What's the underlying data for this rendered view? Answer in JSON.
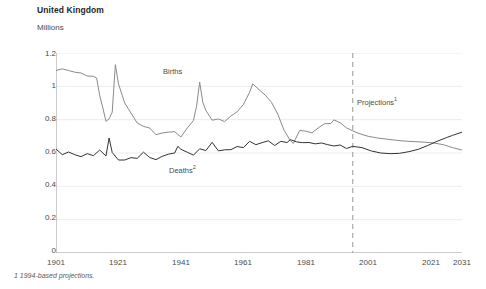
{
  "title": "United Kingdom",
  "units": "Millions",
  "footnote": "1  1994-based projections.",
  "labels": {
    "births": "Births",
    "deaths": "Deaths",
    "deaths_sup": "2",
    "projections": "Projections",
    "projections_sup": "1"
  },
  "colors": {
    "births": "#8a8a8a",
    "deaths": "#333333",
    "axis": "#9a9a9a",
    "grid": "#ededed",
    "projection_divider": "#b0b0b0",
    "text": "#4a4a4a",
    "title": "#1f1f1f"
  },
  "chart_data": {
    "type": "line",
    "title": "United Kingdom",
    "subtitle": "",
    "xlabel": "",
    "ylabel": "Millions",
    "xlim": [
      1901,
      2031
    ],
    "ylim": [
      0.0,
      1.2
    ],
    "xticks": [
      1901,
      1921,
      1941,
      1961,
      1981,
      2001,
      2021,
      2031
    ],
    "yticks": [
      0.0,
      0.2,
      0.4,
      0.6,
      0.8,
      1.0,
      1.2
    ],
    "grid": true,
    "legend": "inline-annotations",
    "annotations": [
      {
        "text": "Births",
        "x": 1944,
        "y": 1.05
      },
      {
        "text": "Deaths2",
        "x": 1948,
        "y": 0.41
      },
      {
        "text": "Projections1",
        "x": 1999,
        "y": 0.93
      }
    ],
    "projection_start": 1996,
    "series": [
      {
        "name": "Births",
        "color": "#8a8a8a",
        "x": [
          1901,
          1903,
          1905,
          1907,
          1909,
          1911,
          1913,
          1914,
          1915,
          1916,
          1917,
          1918,
          1919,
          1920,
          1921,
          1923,
          1925,
          1927,
          1929,
          1931,
          1933,
          1935,
          1937,
          1939,
          1941,
          1943,
          1945,
          1946,
          1947,
          1948,
          1949,
          1951,
          1953,
          1955,
          1957,
          1959,
          1961,
          1963,
          1964,
          1966,
          1968,
          1970,
          1972,
          1974,
          1976,
          1977,
          1979,
          1981,
          1983,
          1985,
          1987,
          1989,
          1990,
          1992,
          1994,
          1996,
          1998,
          2001,
          2004,
          2007,
          2010,
          2013,
          2016,
          2019,
          2022,
          2025,
          2028,
          2031
        ],
        "y": [
          1.095,
          1.105,
          1.095,
          1.085,
          1.08,
          1.062,
          1.06,
          1.05,
          0.945,
          0.87,
          0.79,
          0.805,
          0.845,
          1.13,
          1.015,
          0.9,
          0.84,
          0.78,
          0.76,
          0.75,
          0.71,
          0.72,
          0.725,
          0.728,
          0.696,
          0.749,
          0.795,
          0.88,
          1.025,
          0.905,
          0.855,
          0.797,
          0.804,
          0.789,
          0.822,
          0.847,
          0.891,
          0.965,
          1.015,
          0.98,
          0.947,
          0.904,
          0.834,
          0.737,
          0.675,
          0.657,
          0.735,
          0.731,
          0.721,
          0.751,
          0.776,
          0.777,
          0.799,
          0.781,
          0.751,
          0.733,
          0.717,
          0.7,
          0.69,
          0.683,
          0.676,
          0.671,
          0.668,
          0.665,
          0.66,
          0.65,
          0.632,
          0.618
        ]
      },
      {
        "name": "Deaths",
        "color": "#333333",
        "x": [
          1901,
          1903,
          1905,
          1907,
          1909,
          1911,
          1913,
          1915,
          1917,
          1918,
          1919,
          1921,
          1923,
          1925,
          1927,
          1929,
          1931,
          1933,
          1935,
          1937,
          1939,
          1940,
          1941,
          1943,
          1945,
          1947,
          1949,
          1951,
          1953,
          1955,
          1957,
          1959,
          1961,
          1963,
          1965,
          1967,
          1969,
          1971,
          1973,
          1975,
          1976,
          1978,
          1980,
          1982,
          1984,
          1986,
          1988,
          1990,
          1992,
          1994,
          1996,
          1999,
          2002,
          2005,
          2008,
          2011,
          2014,
          2017,
          2020,
          2023,
          2026,
          2028,
          2031
        ],
        "y": [
          0.624,
          0.59,
          0.606,
          0.59,
          0.578,
          0.596,
          0.584,
          0.618,
          0.582,
          0.69,
          0.603,
          0.558,
          0.558,
          0.572,
          0.568,
          0.605,
          0.573,
          0.56,
          0.58,
          0.593,
          0.6,
          0.64,
          0.622,
          0.605,
          0.587,
          0.625,
          0.615,
          0.664,
          0.613,
          0.619,
          0.62,
          0.639,
          0.632,
          0.67,
          0.65,
          0.662,
          0.673,
          0.645,
          0.67,
          0.663,
          0.68,
          0.667,
          0.662,
          0.663,
          0.655,
          0.66,
          0.65,
          0.642,
          0.648,
          0.627,
          0.64,
          0.632,
          0.612,
          0.6,
          0.596,
          0.598,
          0.608,
          0.622,
          0.645,
          0.67,
          0.692,
          0.706,
          0.725
        ]
      }
    ]
  }
}
